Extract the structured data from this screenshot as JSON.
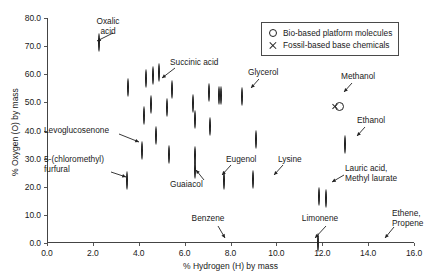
{
  "chart_data": {
    "type": "scatter",
    "title": "",
    "xlabel": "% Hydrogen (H) by mass",
    "ylabel": "% Oxygen (O) by mass",
    "xlim": [
      0.0,
      16.0
    ],
    "ylim": [
      0.0,
      80.0
    ],
    "xticks": [
      "0.0",
      "2.0",
      "4.0",
      "6.0",
      "8.0",
      "10.0",
      "12.0",
      "14.0",
      "16.0"
    ],
    "xtick_values": [
      0.0,
      2.0,
      4.0,
      6.0,
      8.0,
      10.0,
      12.0,
      14.0,
      16.0
    ],
    "yticks": [
      "0.0",
      "10.0",
      "20.0",
      "30.0",
      "40.0",
      "50.0",
      "60.0",
      "70.0",
      "80.0"
    ],
    "ytick_values": [
      0.0,
      10.0,
      20.0,
      30.0,
      40.0,
      50.0,
      60.0,
      70.0,
      80.0
    ],
    "grid": false,
    "legend_position": "top-right",
    "legend": [
      {
        "symbol": "circle",
        "label": "Bio-based platform molecules"
      },
      {
        "symbol": "x",
        "label": "Fossil-based base chemicals"
      }
    ],
    "series": [
      {
        "name": "Bio-based platform molecules",
        "marker": "circle",
        "points": [
          {
            "x": 2.25,
            "y": 71.0,
            "label": "Oxalic acid"
          },
          {
            "x": 3.55,
            "y": 55.0,
            "label": ""
          },
          {
            "x": 4.3,
            "y": 58.4,
            "label": ""
          },
          {
            "x": 4.6,
            "y": 59.3,
            "label": ""
          },
          {
            "x": 4.9,
            "y": 60.6,
            "label": ""
          },
          {
            "x": 5.45,
            "y": 54.4,
            "label": "Succinic acid"
          },
          {
            "x": 4.55,
            "y": 49.2,
            "label": ""
          },
          {
            "x": 5.25,
            "y": 48.0,
            "label": ""
          },
          {
            "x": 4.25,
            "y": 45.0,
            "label": ""
          },
          {
            "x": 6.35,
            "y": 49.4,
            "label": ""
          },
          {
            "x": 7.05,
            "y": 53.4,
            "label": ""
          },
          {
            "x": 6.45,
            "y": 43.7,
            "label": ""
          },
          {
            "x": 7.5,
            "y": 52.2,
            "label": ""
          },
          {
            "x": 7.6,
            "y": 52.2,
            "label": ""
          },
          {
            "x": 8.5,
            "y": 52.0,
            "label": "Glycerol"
          },
          {
            "x": 7.1,
            "y": 41.2,
            "label": ""
          },
          {
            "x": 4.75,
            "y": 38.2,
            "label": ""
          },
          {
            "x": 4.15,
            "y": 32.8,
            "label": "Levoglucosenone"
          },
          {
            "x": 5.3,
            "y": 31.3,
            "label": ""
          },
          {
            "x": 6.45,
            "y": 30.9,
            "label": ""
          },
          {
            "x": 6.45,
            "y": 25.8,
            "label": "Guaiacol"
          },
          {
            "x": 3.5,
            "y": 22.0,
            "label": "5-(chloromethyl) furfural"
          },
          {
            "x": 7.7,
            "y": 22.0,
            "label": "Eugenol"
          },
          {
            "x": 9.0,
            "y": 22.3,
            "label": "Lysine"
          },
          {
            "x": 9.1,
            "y": 36.6,
            "label": ""
          },
          {
            "x": 12.55,
            "y": 50.0,
            "label": "Methanol"
          },
          {
            "x": 13.0,
            "y": 35.0,
            "label": "Ethanol"
          },
          {
            "x": 11.85,
            "y": 16.5,
            "label": "Lauric acid, Methyl laurate"
          },
          {
            "x": 12.15,
            "y": 15.8,
            "label": "Lauric acid, Methyl laurate"
          },
          {
            "x": 11.8,
            "y": 0.0,
            "label": "Limonene"
          }
        ]
      },
      {
        "name": "Fossil-based base chemicals",
        "marker": "x",
        "points": [
          {
            "x": 7.7,
            "y": 0.0,
            "label": "Benzene"
          },
          {
            "x": 8.75,
            "y": 0.0,
            "label": ""
          },
          {
            "x": 9.6,
            "y": 0.0,
            "label": ""
          },
          {
            "x": 11.1,
            "y": 0.0,
            "label": ""
          },
          {
            "x": 14.3,
            "y": 0.0,
            "label": "Ethene, Propene"
          },
          {
            "x": 12.55,
            "y": 50.0,
            "label": "Methanol"
          }
        ]
      }
    ],
    "annotations": [
      {
        "name": "oxalic-acid",
        "text": "Oxalic\nacid"
      },
      {
        "name": "succinic-acid",
        "text": "Succinic acid"
      },
      {
        "name": "glycerol",
        "text": "Glycerol"
      },
      {
        "name": "methanol",
        "text": "Methanol"
      },
      {
        "name": "ethanol",
        "text": "Ethanol"
      },
      {
        "name": "levoglucosenone",
        "text": "Levoglucosenone"
      },
      {
        "name": "chloromethyl-furfural",
        "text": "5-(chloromethyl)\nfurfural"
      },
      {
        "name": "guaiacol",
        "text": "Guaiacol"
      },
      {
        "name": "eugenol",
        "text": "Eugenol"
      },
      {
        "name": "lysine",
        "text": "Lysine"
      },
      {
        "name": "lauric-acid",
        "text": "Lauric acid,\nMethyl laurate"
      },
      {
        "name": "benzene",
        "text": "Benzene"
      },
      {
        "name": "limonene",
        "text": "Limonene"
      },
      {
        "name": "ethene-propene",
        "text": "Ethene,\nPropene"
      }
    ]
  },
  "annotations_text": {
    "oxalic_acid": "Oxalic\nacid",
    "succinic_acid": "Succinic acid",
    "glycerol": "Glycerol",
    "methanol": "Methanol",
    "ethanol": "Ethanol",
    "levoglucosenone": "Levoglucosenone",
    "chloromethyl_furfural": "5-(chloromethyl)\nfurfural",
    "guaiacol": "Guaiacol",
    "eugenol": "Eugenol",
    "lysine": "Lysine",
    "lauric_acid": "Lauric acid,\nMethyl laurate",
    "benzene": "Benzene",
    "limonene": "Limonene",
    "ethene_propene": "Ethene,\nPropene"
  },
  "colors": {
    "marker": "#222222",
    "axis": "#444444",
    "background": "#ffffff",
    "text": "#1a1a1a"
  }
}
